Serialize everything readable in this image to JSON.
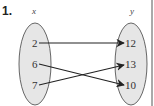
{
  "problem_number": "1.",
  "domain_set": {
    "label": "x",
    "values": [
      "2",
      "6",
      "7"
    ]
  },
  "range_set": {
    "label": "y",
    "values": [
      "12",
      "13",
      "10"
    ]
  },
  "mappings": [
    {
      "from": "2",
      "to": "12"
    },
    {
      "from": "6",
      "to": "10"
    },
    {
      "from": "7",
      "to": "13"
    }
  ],
  "colors": {
    "oval_fill": "#e6e6e6",
    "oval_stroke": "#666666",
    "arrow": "#222222",
    "border": "#555555"
  }
}
